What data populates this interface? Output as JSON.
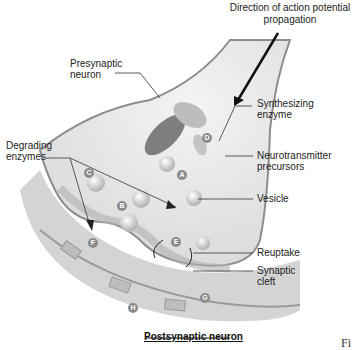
{
  "diagram": {
    "title": "Direction of action potential\npropagation",
    "bottom_label": "Postsynaptic neuron",
    "figure_caption_fragment": "Fi",
    "labels": {
      "presynaptic": "Presynaptic\nneuron",
      "degrading": "Degrading\nenzymes",
      "synthesizing": "Synthesizing\nenzyme",
      "precursors": "Neurotransmitter\nprecursors",
      "vesicle": "Vesicle",
      "reuptake": "Reuptake",
      "cleft": "Synaptic\ncleft"
    },
    "markers": [
      "A",
      "B",
      "C",
      "D",
      "E",
      "F",
      "G",
      "H"
    ]
  }
}
